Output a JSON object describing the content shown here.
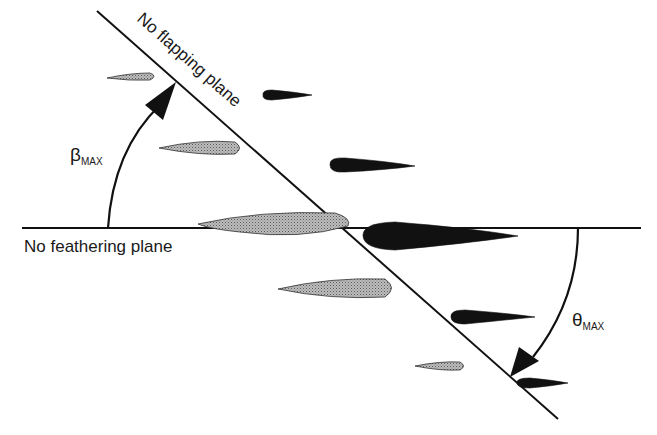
{
  "labels": {
    "no_flapping_plane": "No flapping plane",
    "no_feathering_plane": "No feathering plane",
    "beta_symbol": "β",
    "beta_subscript": "MAX",
    "theta_symbol": "θ",
    "theta_subscript": "MAX"
  },
  "colors": {
    "line": "#111111",
    "grey_blade": "#9a9a9a",
    "black_blade": "#111111"
  }
}
